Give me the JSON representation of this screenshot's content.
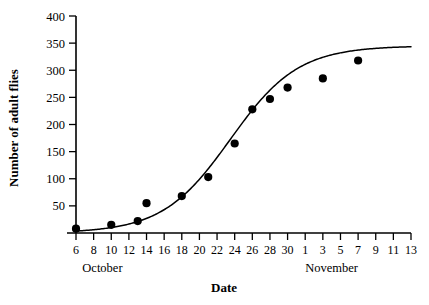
{
  "chart_data": {
    "type": "scatter",
    "title": "",
    "xlabel": "Date",
    "ylabel": "Number of adult flies",
    "grid": false,
    "legend": null,
    "xlim": [
      6,
      44
    ],
    "ylim": [
      0,
      400
    ],
    "y_ticks": [
      50,
      100,
      150,
      200,
      250,
      300,
      350,
      400
    ],
    "x_ticks": [
      6,
      8,
      10,
      12,
      14,
      16,
      18,
      20,
      22,
      24,
      26,
      28,
      30,
      1,
      3,
      5,
      7,
      9,
      11,
      13
    ],
    "x_group_labels": [
      {
        "label": "October",
        "x": 9
      },
      {
        "label": "November",
        "x": 35
      }
    ],
    "points": [
      {
        "x": 6,
        "y": 8,
        "date": "October 6"
      },
      {
        "x": 10,
        "y": 15,
        "date": "October 10"
      },
      {
        "x": 13,
        "y": 22,
        "date": "October 13"
      },
      {
        "x": 14,
        "y": 55,
        "date": "October 14"
      },
      {
        "x": 18,
        "y": 68,
        "date": "October 18"
      },
      {
        "x": 21,
        "y": 103,
        "date": "October 21"
      },
      {
        "x": 24,
        "y": 165,
        "date": "October 24"
      },
      {
        "x": 26,
        "y": 228,
        "date": "October 26"
      },
      {
        "x": 28,
        "y": 247,
        "date": "October 28"
      },
      {
        "x": 30,
        "y": 268,
        "date": "October 30"
      },
      {
        "x": 34,
        "y": 285,
        "date": "November 3"
      },
      {
        "x": 38,
        "y": 318,
        "date": "November 7"
      }
    ],
    "fit_curve": {
      "kind": "logistic",
      "L": 345,
      "k": 0.26,
      "x0": 23.5,
      "description": "sigmoid growth curve fitted through the data points"
    },
    "series_color": "#000000",
    "curve_color": "#000000"
  }
}
